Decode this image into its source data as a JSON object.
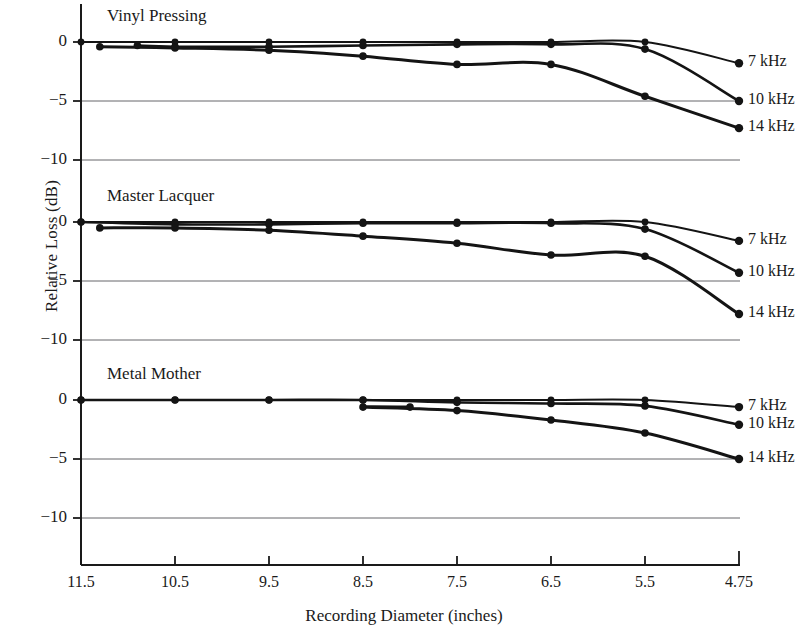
{
  "figure": {
    "xlabel": "Recording Diameter (inches)",
    "ylabel": "Relative Loss (dB)",
    "axis_color": "#1a1a1a",
    "grid_color": "#55555a",
    "curve_color": "#141414"
  },
  "chart_data": {
    "type": "line",
    "title": "",
    "xlabel": "Recording Diameter (inches)",
    "ylabel": "Relative Loss (dB)",
    "x": [
      11.5,
      10.5,
      9.5,
      8.5,
      7.5,
      6.5,
      5.5,
      4.75
    ],
    "xtick_labels": [
      "11.5",
      "10.5",
      "9.5",
      "8.5",
      "7.5",
      "6.5",
      "5.5",
      "4.75"
    ],
    "x_axis_inverted": true,
    "ytick_labels": [
      "0",
      "-5",
      "-10"
    ],
    "yticks": [
      0,
      -5,
      -10
    ],
    "ylim": [
      -12.5,
      1.5
    ],
    "grid": "horizontal gridlines at -5 and -10 in each panel",
    "legend_position": "right of each panel, inline at curve ends",
    "panels": [
      {
        "name": "Vinyl Pressing",
        "label": "Vinyl Pressing",
        "series": [
          {
            "name": "7 kHz",
            "end_label": "7 kHz",
            "x": [
              11.5,
              10.5,
              9.5,
              8.5,
              7.5,
              6.5,
              5.5,
              4.75
            ],
            "values": [
              0.0,
              0.0,
              0.0,
              0.0,
              0.0,
              0.0,
              0.0,
              -1.8
            ]
          },
          {
            "name": "10 kHz",
            "end_label": "10 kHz",
            "x": [
              10.9,
              10.5,
              9.5,
              8.5,
              7.5,
              6.5,
              5.5,
              4.75
            ],
            "values": [
              -0.3,
              -0.4,
              -0.4,
              -0.3,
              -0.2,
              -0.2,
              -0.6,
              -5.0
            ]
          },
          {
            "name": "14 kHz",
            "end_label": "14 kHz",
            "x": [
              11.3,
              10.5,
              9.5,
              8.5,
              7.5,
              6.5,
              5.5,
              4.75
            ],
            "values": [
              -0.4,
              -0.5,
              -0.7,
              -1.2,
              -1.9,
              -1.9,
              -4.6,
              -7.3
            ]
          }
        ]
      },
      {
        "name": "Master Lacquer",
        "label": "Master Lacquer",
        "series": [
          {
            "name": "7 kHz",
            "end_label": "7 kHz",
            "x": [
              11.5,
              10.5,
              9.5,
              8.5,
              7.5,
              6.5,
              5.5,
              4.75
            ],
            "values": [
              0.0,
              0.0,
              0.0,
              0.0,
              0.0,
              0.0,
              0.0,
              -1.6
            ]
          },
          {
            "name": "10 kHz",
            "end_label": "10 kHz",
            "x": [
              11.5,
              10.5,
              9.5,
              8.5,
              7.5,
              6.5,
              5.5,
              4.75
            ],
            "values": [
              0.0,
              -0.2,
              -0.2,
              -0.1,
              -0.1,
              -0.1,
              -0.6,
              -4.3
            ]
          },
          {
            "name": "14 kHz",
            "end_label": "14 kHz",
            "x": [
              11.3,
              10.5,
              9.5,
              8.5,
              7.5,
              6.5,
              5.5,
              4.75
            ],
            "values": [
              -0.5,
              -0.5,
              -0.7,
              -1.2,
              -1.8,
              -2.8,
              -2.9,
              -7.8
            ]
          }
        ]
      },
      {
        "name": "Metal Mother",
        "label": "Metal Mother",
        "series": [
          {
            "name": "7 kHz",
            "end_label": "7 kHz",
            "x": [
              11.5,
              10.5,
              9.5,
              8.5,
              7.5,
              6.5,
              5.5,
              4.75
            ],
            "values": [
              0.0,
              0.0,
              0.0,
              0.0,
              0.0,
              0.0,
              0.0,
              -0.6
            ]
          },
          {
            "name": "10 kHz",
            "end_label": "10 kHz",
            "x": [
              11.5,
              10.5,
              9.5,
              8.5,
              7.5,
              6.5,
              5.5,
              4.75
            ],
            "values": [
              0.0,
              0.0,
              0.0,
              0.0,
              -0.2,
              -0.3,
              -0.5,
              -2.1
            ]
          },
          {
            "name": "14 kHz",
            "end_label": "14 kHz",
            "x": [
              8.0,
              8.5,
              7.5,
              6.5,
              5.5,
              4.75
            ],
            "values": [
              -0.6,
              -0.6,
              -0.9,
              -1.7,
              -2.8,
              -5.0
            ]
          }
        ]
      }
    ]
  },
  "geometry": {
    "axis_x": 81,
    "x_step": 94,
    "panel_zero_y": [
      42,
      222,
      400
    ],
    "db_per_px": 11.8,
    "axis_bottom_y": 565,
    "right_edge_x": 740,
    "label_x": 748
  }
}
